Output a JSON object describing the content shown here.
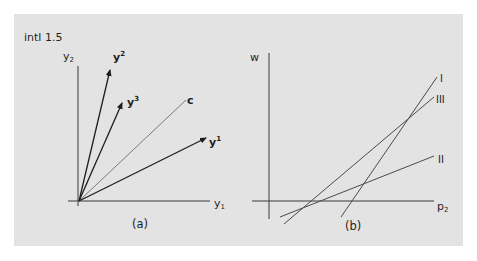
{
  "figure": {
    "tag": "intl 1.5",
    "panel_background": "#e3e3e3",
    "line_color": "#2a2a2a",
    "light_line_color": "#7a7a7a"
  },
  "panel_a": {
    "caption": "(a)",
    "axes": {
      "x_label_base": "y",
      "x_label_sub": "1",
      "y_label_base": "y",
      "y_label_sub": "2"
    },
    "vectors": [
      {
        "base": "y",
        "sup": "2",
        "name": "y2"
      },
      {
        "base": "y",
        "sup": "3",
        "name": "y3"
      },
      {
        "base": "y",
        "sup": "1",
        "name": "y1"
      }
    ],
    "ray": {
      "label": "c"
    }
  },
  "panel_b": {
    "caption": "(b)",
    "axes": {
      "x_label_base": "p",
      "x_label_sub": "2",
      "y_label": "w"
    },
    "lines": [
      {
        "label": "I"
      },
      {
        "label": "III"
      },
      {
        "label": "II"
      }
    ]
  }
}
